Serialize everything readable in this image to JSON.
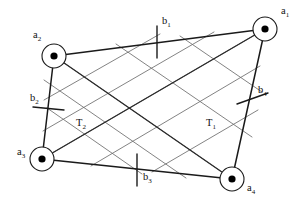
{
  "figure": {
    "background_color": "#ffffff",
    "line_color": "#1a1a1a",
    "lattice_color": "#6d6d6d",
    "width": 303,
    "height": 202
  },
  "nodes": [
    {
      "id": "a1",
      "label": "a",
      "subscript": "1",
      "cx": 265,
      "cy": 29,
      "r": 12,
      "dot_r": 3.6,
      "label_x": 281,
      "label_y": 14
    },
    {
      "id": "a2",
      "label": "a",
      "subscript": "2",
      "cx": 54,
      "cy": 56,
      "r": 12,
      "dot_r": 3.6,
      "label_x": 33,
      "label_y": 38
    },
    {
      "id": "a3",
      "label": "a",
      "subscript": "3",
      "cx": 42,
      "cy": 159,
      "r": 12,
      "dot_r": 3.6,
      "label_x": 17,
      "label_y": 155
    },
    {
      "id": "a4",
      "label": "a",
      "subscript": "4",
      "cx": 232,
      "cy": 179,
      "r": 12,
      "dot_r": 3.6,
      "label_x": 247,
      "label_y": 191
    }
  ],
  "edges": [
    {
      "id": "edge-a2-a1",
      "from": "a2",
      "to": "a1",
      "x1": 54,
      "y1": 56,
      "x2": 265,
      "y2": 29
    },
    {
      "id": "edge-a1-a4",
      "from": "a1",
      "to": "a4",
      "x1": 265,
      "y1": 29,
      "x2": 232,
      "y2": 179
    },
    {
      "id": "edge-a4-a3",
      "from": "a4",
      "to": "a3",
      "x1": 232,
      "y1": 179,
      "x2": 42,
      "y2": 159
    },
    {
      "id": "edge-a3-a2",
      "from": "a3",
      "to": "a2",
      "x1": 42,
      "y1": 159,
      "x2": 54,
      "y2": 56
    }
  ],
  "diagonals": [
    {
      "id": "diag-T1",
      "label": "T",
      "subscript": "1",
      "from": "a3",
      "to": "a1",
      "x1": 42,
      "y1": 159,
      "x2": 265,
      "y2": 29,
      "label_x": 206,
      "label_y": 126
    },
    {
      "id": "diag-T2",
      "label": "T",
      "subscript": "2",
      "from": "a2",
      "to": "a4",
      "x1": 54,
      "y1": 56,
      "x2": 232,
      "y2": 179,
      "label_x": 76,
      "label_y": 126
    }
  ],
  "tick_marks": [
    {
      "id": "b1",
      "label": "b",
      "subscript": "1",
      "edge": "edge-a2-a1",
      "x1": 157,
      "y1": 26,
      "x2": 157,
      "y2": 58,
      "label_x": 162,
      "label_y": 24
    },
    {
      "id": "b2",
      "label": "b",
      "subscript": "2",
      "edge": "edge-a3-a2",
      "x1": 33,
      "y1": 107,
      "x2": 64,
      "y2": 110,
      "label_x": 30,
      "label_y": 101
    },
    {
      "id": "b3",
      "label": "b",
      "subscript": "3",
      "edge": "edge-a4-a3",
      "x1": 137,
      "y1": 154,
      "x2": 137,
      "y2": 186,
      "label_x": 143,
      "label_y": 180
    },
    {
      "id": "b4",
      "label": "b",
      "subscript": "4",
      "edge": "edge-a1-a4",
      "x1": 237,
      "y1": 104,
      "x2": 268,
      "y2": 93,
      "label_x": 258,
      "label_y": 93
    }
  ],
  "lattice_lines": [
    {
      "id": "lat-d1-1",
      "direction": "down-right",
      "x1": 54,
      "y1": 56,
      "x2": 232,
      "y2": 179
    },
    {
      "id": "lat-d1-2",
      "direction": "down-right",
      "x1": 44,
      "y1": 80,
      "x2": 186,
      "y2": 178
    },
    {
      "id": "lat-d1-3",
      "direction": "down-right",
      "x1": 47,
      "y1": 108,
      "x2": 142,
      "y2": 174
    },
    {
      "id": "lat-d1-4",
      "direction": "down-right",
      "x1": 116,
      "y1": 44,
      "x2": 252,
      "y2": 137
    },
    {
      "id": "lat-d1-5",
      "direction": "down-right",
      "x1": 180,
      "y1": 36,
      "x2": 262,
      "y2": 92
    },
    {
      "id": "lat-d2-1",
      "direction": "up-right",
      "x1": 42,
      "y1": 159,
      "x2": 265,
      "y2": 29
    },
    {
      "id": "lat-d2-2",
      "direction": "up-right",
      "x1": 43,
      "y1": 131,
      "x2": 214,
      "y2": 32
    },
    {
      "id": "lat-d2-3",
      "direction": "up-right",
      "x1": 44,
      "y1": 100,
      "x2": 160,
      "y2": 34
    },
    {
      "id": "lat-d2-4",
      "direction": "up-right",
      "x1": 91,
      "y1": 166,
      "x2": 260,
      "y2": 66
    },
    {
      "id": "lat-d2-5",
      "direction": "up-right",
      "x1": 152,
      "y1": 172,
      "x2": 258,
      "y2": 110
    }
  ]
}
